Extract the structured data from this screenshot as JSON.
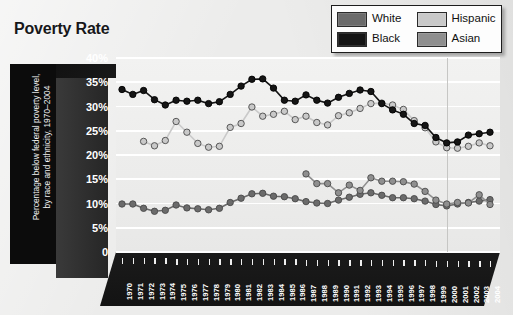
{
  "title": "Poverty Rate",
  "legend": {
    "items": [
      {
        "label": "White",
        "color": "#6b6b6b"
      },
      {
        "label": "Hispanic",
        "color": "#c9c9c9"
      },
      {
        "label": "Black",
        "color": "#151515"
      },
      {
        "label": "Asian",
        "color": "#8f8f8f"
      }
    ]
  },
  "axis": {
    "y_title": "Percentage below federal poverty level,",
    "y_title2": "by race and ethnicity, 1970–2004",
    "y_ticks": [
      "40%",
      "35%",
      "30%",
      "25%",
      "20%",
      "15%",
      "10%",
      "5%",
      "0"
    ]
  },
  "chart_data": {
    "type": "line",
    "title": "Poverty Rate",
    "xlabel": "",
    "ylabel": "Percentage below federal poverty level, by race and ethnicity, 1970–2004",
    "ylim": [
      0,
      40
    ],
    "ytick_values": [
      0,
      5,
      10,
      15,
      20,
      25,
      30,
      35,
      40
    ],
    "grid": true,
    "legend_position": "top-right",
    "categories": [
      "1970",
      "1971",
      "1972",
      "1973",
      "1974",
      "1975",
      "1976",
      "1977",
      "1978",
      "1979",
      "1980",
      "1981",
      "1982",
      "1983",
      "1984",
      "1985",
      "1986",
      "1987",
      "1988",
      "1989",
      "1990",
      "1991",
      "1992",
      "1993",
      "1994",
      "1995",
      "1996",
      "1997",
      "1998",
      "1999",
      "2000",
      "2001",
      "2002",
      "2003",
      "2004"
    ],
    "series": [
      {
        "name": "Black",
        "color": "#151515",
        "values": [
          33.5,
          32.5,
          33.3,
          31.4,
          30.3,
          31.3,
          31.1,
          31.3,
          30.6,
          31.0,
          32.5,
          34.2,
          35.6,
          35.7,
          33.8,
          31.3,
          31.1,
          32.4,
          31.3,
          30.7,
          31.9,
          32.7,
          33.4,
          33.1,
          30.6,
          29.3,
          28.4,
          26.5,
          26.1,
          23.6,
          22.5,
          22.7,
          24.1,
          24.4,
          24.7
        ]
      },
      {
        "name": "Hispanic",
        "color": "#c9c9c9",
        "values": [
          null,
          null,
          22.8,
          21.9,
          23.0,
          26.9,
          24.7,
          22.4,
          21.6,
          21.8,
          25.7,
          26.5,
          29.9,
          28.0,
          28.4,
          29.0,
          27.3,
          28.0,
          26.7,
          26.2,
          28.1,
          28.7,
          29.6,
          30.6,
          30.7,
          30.3,
          29.4,
          27.1,
          25.6,
          22.7,
          21.5,
          21.4,
          21.8,
          22.5,
          21.9
        ]
      },
      {
        "name": "White",
        "color": "#6b6b6b",
        "values": [
          9.9,
          9.9,
          9.0,
          8.4,
          8.6,
          9.7,
          9.1,
          8.9,
          8.7,
          9.0,
          10.2,
          11.1,
          12.0,
          12.1,
          11.5,
          11.4,
          11.0,
          10.4,
          10.1,
          10.0,
          10.7,
          11.3,
          11.9,
          12.2,
          11.7,
          11.2,
          11.2,
          11.0,
          10.5,
          9.8,
          9.5,
          9.9,
          10.2,
          10.5,
          10.8
        ]
      },
      {
        "name": "Asian",
        "color": "#8f8f8f",
        "values": [
          null,
          null,
          null,
          null,
          null,
          null,
          null,
          null,
          null,
          null,
          null,
          null,
          null,
          null,
          null,
          null,
          null,
          16.1,
          14.1,
          14.1,
          12.2,
          13.8,
          12.7,
          15.3,
          14.6,
          14.6,
          14.5,
          14.0,
          12.5,
          10.7,
          9.9,
          10.2,
          10.1,
          11.8,
          9.8
        ]
      }
    ]
  }
}
